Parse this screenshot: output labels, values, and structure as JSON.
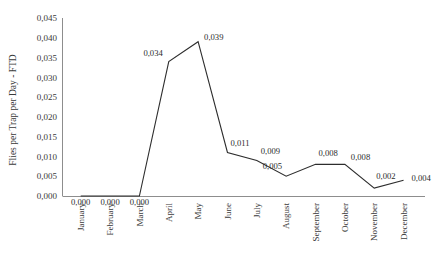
{
  "chart_data": {
    "type": "line",
    "title": "",
    "xlabel": "",
    "ylabel": "Flies per Trap per Day - FTD",
    "categories": [
      "January",
      "February",
      "March",
      "April",
      "May",
      "June",
      "July",
      "August",
      "September",
      "October",
      "November",
      "December"
    ],
    "values": [
      0.0,
      0.0,
      0.0,
      0.034,
      0.039,
      0.011,
      0.009,
      0.005,
      0.008,
      0.008,
      0.002,
      0.004
    ],
    "point_labels": [
      "0,000",
      "0,000",
      "0,000",
      "0,034",
      "0,039",
      "0,011",
      "0,009",
      "0,005",
      "0,008",
      "0,008",
      "0,002",
      "0,004"
    ],
    "ylim": [
      0,
      0.045
    ],
    "ytick_values": [
      0.0,
      0.005,
      0.01,
      0.015,
      0.02,
      0.025,
      0.03,
      0.035,
      0.04,
      0.045
    ],
    "ytick_labels": [
      "0,000",
      "0,005",
      "0,010",
      "0,015",
      "0,020",
      "0,025",
      "0,030",
      "0,035",
      "0,040",
      "0,045"
    ],
    "grid": false,
    "legend": false,
    "legend_position": "none",
    "decimal_separator": ",",
    "series_color": "#2d2d2d",
    "axis_color": "#8d8d8d",
    "text_color": "#3a3a3a",
    "label_offsets": [
      {
        "dx": 0,
        "dy": 9,
        "anchor": "middle"
      },
      {
        "dx": 0,
        "dy": 9,
        "anchor": "middle"
      },
      {
        "dx": 0,
        "dy": 9,
        "anchor": "middle"
      },
      {
        "dx": -6,
        "dy": -6,
        "anchor": "end"
      },
      {
        "dx": 6,
        "dy": -2,
        "anchor": "start"
      },
      {
        "dx": 3,
        "dy": -6,
        "anchor": "start"
      },
      {
        "dx": 4,
        "dy": -6,
        "anchor": "start"
      },
      {
        "dx": -4,
        "dy": -7,
        "anchor": "end"
      },
      {
        "dx": 3,
        "dy": -8,
        "anchor": "start"
      },
      {
        "dx": 6,
        "dy": -4,
        "anchor": "start"
      },
      {
        "dx": 2,
        "dy": -9,
        "anchor": "start"
      },
      {
        "dx": 8,
        "dy": 1,
        "anchor": "start"
      }
    ]
  }
}
